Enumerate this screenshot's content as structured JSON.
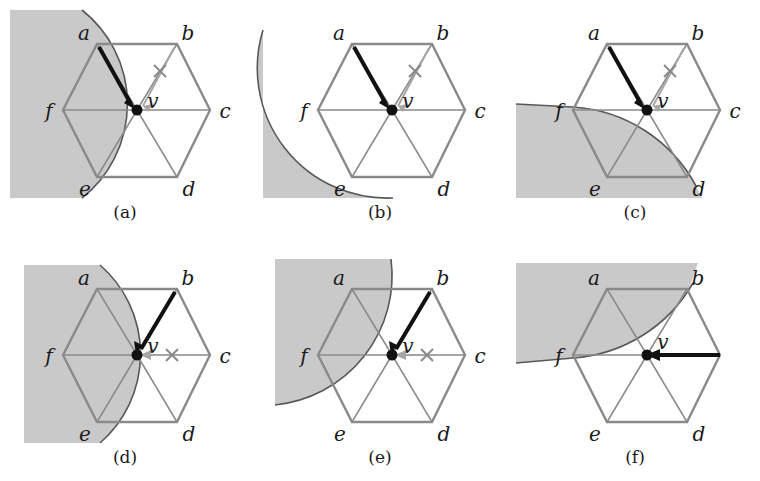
{
  "figure": {
    "type": "diagram",
    "shade_color": "#c9c9c9",
    "line_color": "#6e6e6e",
    "bold_color": "#111111",
    "grey_arrow_color": "#9a9a9a",
    "text_color": "#1a1a1a",
    "background": "#ffffff"
  },
  "geometry": {
    "center_label": "v",
    "vertex_labels": [
      "a",
      "b",
      "c",
      "d",
      "e",
      "f"
    ],
    "hexagon_points": {
      "a": [
        97,
        44
      ],
      "b": [
        177,
        44
      ],
      "c": [
        210,
        110
      ],
      "d": [
        177,
        177
      ],
      "e": [
        97,
        177
      ],
      "f": [
        63,
        110
      ],
      "v": [
        137,
        110
      ]
    }
  },
  "panels": [
    {
      "id": "panel-a",
      "caption": "(a)",
      "bold_arrow": {
        "from": "a",
        "to": "v"
      },
      "grey_arrow": {
        "from": "b",
        "to": "v",
        "x_mark": true
      },
      "shade": "halfplane-left-with-bulge",
      "shade_note": "vertical slab on the left bounded by an arc bulging right through the a-f-e side"
    },
    {
      "id": "panel-b",
      "caption": "(b)",
      "bold_arrow": {
        "from": "a",
        "to": "v"
      },
      "grey_arrow": {
        "from": "b",
        "to": "v",
        "x_mark": true
      },
      "shade": "disk-lower-left",
      "shade_note": "disk sector centred near v covering the lower-left quadrant past f and e"
    },
    {
      "id": "panel-c",
      "caption": "(c)",
      "bold_arrow": {
        "from": "a",
        "to": "v"
      },
      "grey_arrow": {
        "from": "b",
        "to": "v",
        "x_mark": true
      },
      "shade": "lower-halfplane-with-arc",
      "shade_note": "lower half-plane bounded above by an arc through f and d"
    },
    {
      "id": "panel-d",
      "caption": "(d)",
      "bold_arrow": {
        "from": "b",
        "to": "v"
      },
      "grey_arrow": {
        "from": "c",
        "to": "v",
        "x_mark": true
      },
      "shade": "halfplane-left-wide",
      "shade_note": "vertical slab on the left bounded by an arc through a and e covering the a-f-e triangle"
    },
    {
      "id": "panel-e",
      "caption": "(e)",
      "bold_arrow": {
        "from": "b",
        "to": "v"
      },
      "grey_arrow": {
        "from": "c",
        "to": "v",
        "x_mark": true
      },
      "shade": "disk-upper-left",
      "shade_note": "disk sector centred at v covering the upper-left quadrant through a and f"
    },
    {
      "id": "panel-f",
      "caption": "(f)",
      "bold_arrow": {
        "from": "c",
        "to": "v"
      },
      "grey_arrow": null,
      "shade": "upper-halfplane-with-arc",
      "shade_note": "upper half-plane bounded below by an arc through f and b"
    }
  ]
}
